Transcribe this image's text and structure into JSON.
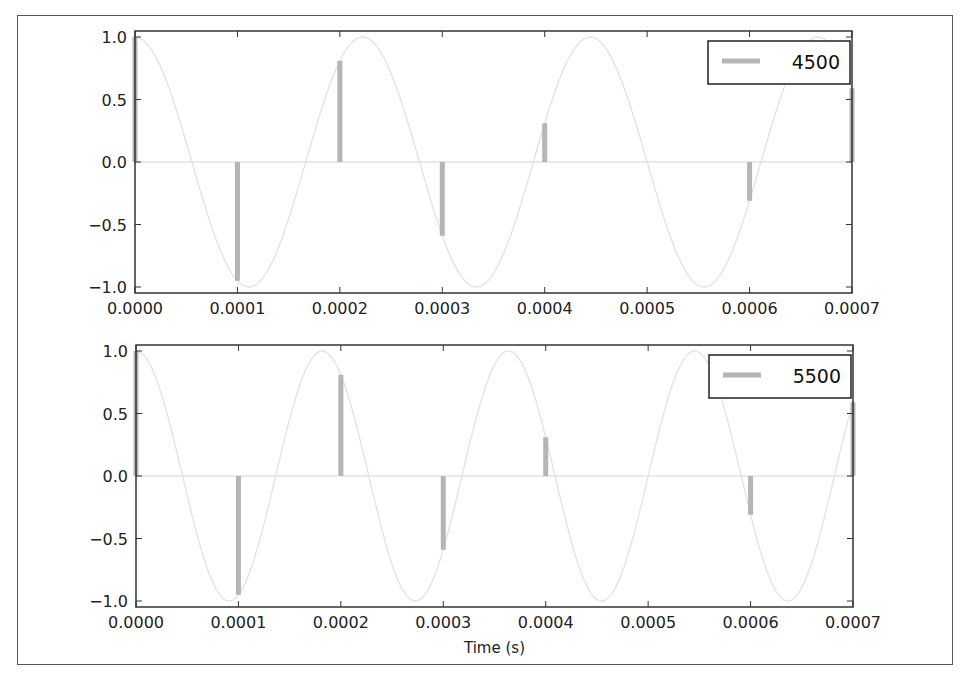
{
  "chart_data": [
    {
      "type": "line",
      "subtype": "stem + continuous sinusoid",
      "title": "",
      "legend": [
        "4500"
      ],
      "legend_position": "upper right",
      "xlabel": "",
      "ylabel": "",
      "xlim": [
        0.0,
        0.0007
      ],
      "ylim": [
        -1.0,
        1.0
      ],
      "xticks": [
        "0.0000",
        "0.0001",
        "0.0002",
        "0.0003",
        "0.0004",
        "0.0005",
        "0.0006",
        "0.0007"
      ],
      "yticks": [
        "1.0",
        "0.5",
        "0.0",
        "−0.5",
        "−1.0"
      ],
      "grid": false,
      "series": [
        {
          "name": "4500",
          "kind": "stem",
          "x": [
            0.0,
            0.0001,
            0.0002,
            0.0003,
            0.0004,
            0.0005,
            0.0006,
            0.0007
          ],
          "values": [
            1.0,
            -0.95,
            0.81,
            -0.59,
            0.31,
            0.0,
            -0.31,
            0.59
          ]
        },
        {
          "name": "continuous 4500 Hz",
          "kind": "line",
          "frequency_hz": 4500
        }
      ]
    },
    {
      "type": "line",
      "subtype": "stem + continuous sinusoid",
      "title": "",
      "legend": [
        "5500"
      ],
      "legend_position": "upper right",
      "xlabel": "Time (s)",
      "ylabel": "",
      "xlim": [
        0.0,
        0.0007
      ],
      "ylim": [
        -1.0,
        1.0
      ],
      "xticks": [
        "0.0000",
        "0.0001",
        "0.0002",
        "0.0003",
        "0.0004",
        "0.0005",
        "0.0006",
        "0.0007"
      ],
      "yticks": [
        "1.0",
        "0.5",
        "0.0",
        "−0.5",
        "−1.0"
      ],
      "grid": false,
      "series": [
        {
          "name": "5500",
          "kind": "stem",
          "x": [
            0.0,
            0.0001,
            0.0002,
            0.0003,
            0.0004,
            0.0005,
            0.0006,
            0.0007
          ],
          "values": [
            1.0,
            -0.95,
            0.81,
            -0.59,
            0.31,
            0.0,
            -0.31,
            0.59
          ]
        },
        {
          "name": "continuous 5500 Hz",
          "kind": "line",
          "frequency_hz": 5500
        }
      ]
    }
  ],
  "colors": {
    "stem": "#b5b5b5",
    "curve": "#e2e2e2",
    "axis": "#333333",
    "text": "#222222"
  }
}
